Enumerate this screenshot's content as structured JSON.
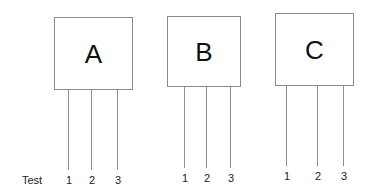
{
  "row_label": "Test",
  "components": [
    {
      "label": "A",
      "box": {
        "x": 54,
        "y": 17,
        "w": 79,
        "h": 73
      },
      "leads": [
        {
          "label": "1",
          "x": 68,
          "y1": 90,
          "y2": 170,
          "label_y": 174
        },
        {
          "label": "2",
          "x": 91,
          "y1": 90,
          "y2": 170,
          "label_y": 174
        },
        {
          "label": "3",
          "x": 117,
          "y1": 90,
          "y2": 170,
          "label_y": 174
        }
      ]
    },
    {
      "label": "B",
      "box": {
        "x": 167,
        "y": 16,
        "w": 74,
        "h": 71
      },
      "leads": [
        {
          "label": "1",
          "x": 184,
          "y1": 87,
          "y2": 168,
          "label_y": 172
        },
        {
          "label": "2",
          "x": 206,
          "y1": 87,
          "y2": 168,
          "label_y": 172
        },
        {
          "label": "3",
          "x": 230,
          "y1": 87,
          "y2": 168,
          "label_y": 172
        }
      ]
    },
    {
      "label": "C",
      "box": {
        "x": 275,
        "y": 13,
        "w": 79,
        "h": 73
      },
      "leads": [
        {
          "label": "1",
          "x": 286,
          "y1": 86,
          "y2": 166,
          "label_y": 170
        },
        {
          "label": "2",
          "x": 317,
          "y1": 86,
          "y2": 166,
          "label_y": 170
        },
        {
          "label": "3",
          "x": 343,
          "y1": 86,
          "y2": 166,
          "label_y": 170
        }
      ]
    }
  ],
  "colors": {
    "line": "#8f8f8f",
    "text": "#111111",
    "background": "#ffffff"
  }
}
